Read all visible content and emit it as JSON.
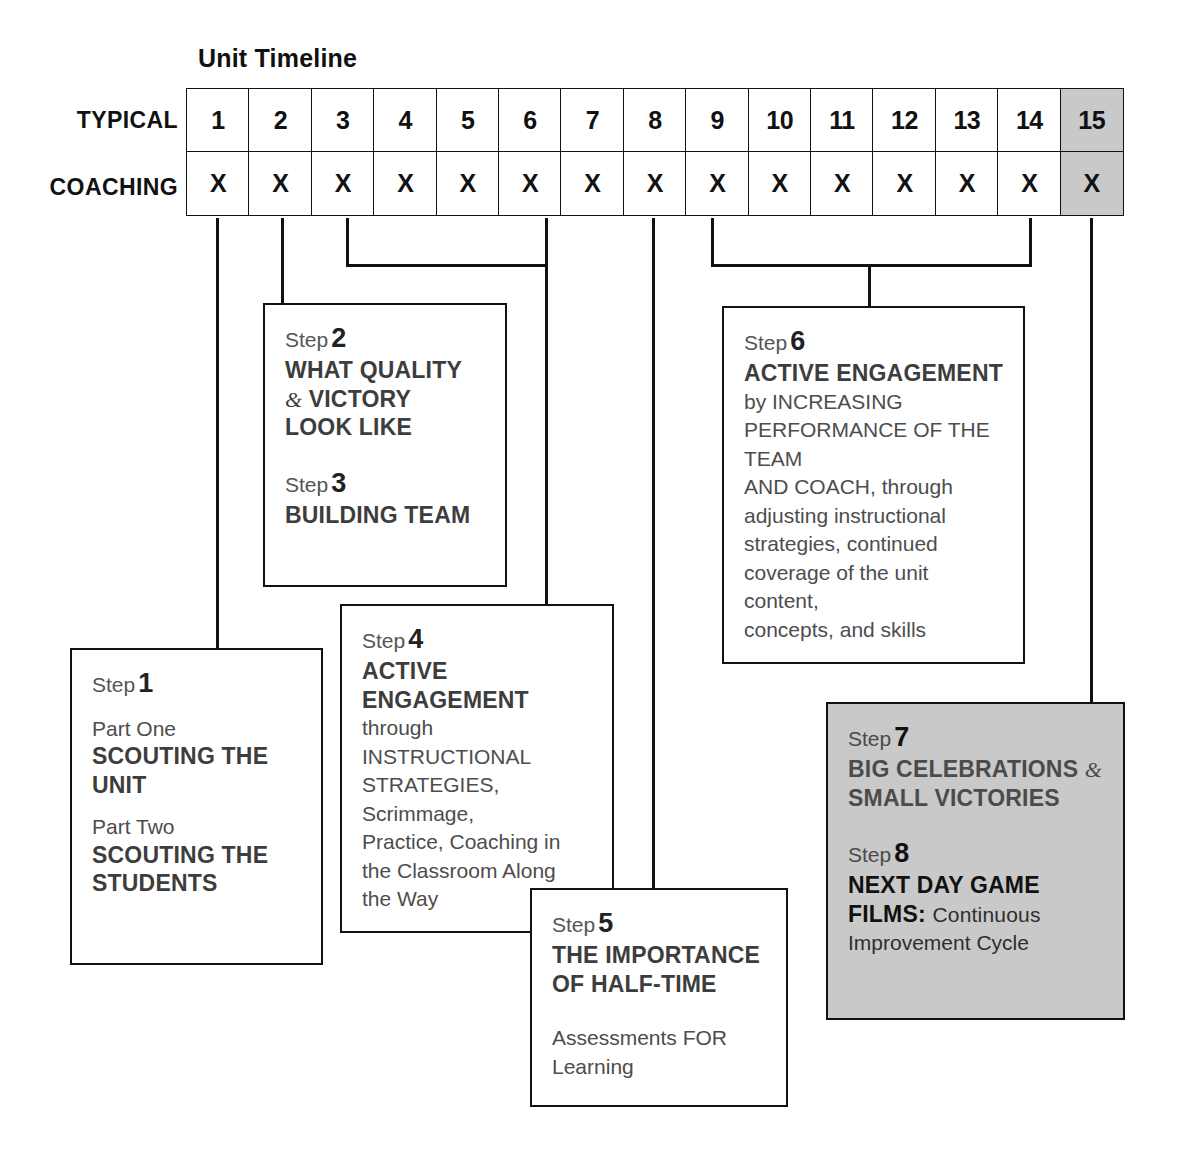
{
  "title": "Unit Timeline",
  "timeline": {
    "rows": [
      {
        "label": "TYPICAL",
        "name": "typical",
        "cells": [
          "1",
          "2",
          "3",
          "4",
          "5",
          "6",
          "7",
          "8",
          "9",
          "10",
          "11",
          "12",
          "13",
          "14",
          "15"
        ]
      },
      {
        "label": "COACHING",
        "name": "coaching",
        "cells": [
          "X",
          "X",
          "X",
          "X",
          "X",
          "X",
          "X",
          "X",
          "X",
          "X",
          "X",
          "X",
          "X",
          "X",
          "X"
        ]
      }
    ],
    "shaded_column_index": 14,
    "shaded_color": "#c9c9c9"
  },
  "steps": {
    "step1": {
      "step_label": "Step",
      "number": "1",
      "part_one_label": "Part One",
      "part_one_title_line1": "SCOUTING THE",
      "part_one_title_line2": "UNIT",
      "part_two_label": "Part Two",
      "part_two_title_line1": "SCOUTING THE",
      "part_two_title_line2": "STUDENTS"
    },
    "step2": {
      "step_label": "Step",
      "number": "2",
      "title_line1": "WHAT QUALITY",
      "amp": "&",
      "title_line2": "VICTORY",
      "title_line3": "LOOK LIKE"
    },
    "step3": {
      "step_label": "Step",
      "number": "3",
      "title": "BUILDING TEAM"
    },
    "step4": {
      "step_label": "Step",
      "number": "4",
      "title_line1": "ACTIVE",
      "title_line2": "ENGAGEMENT",
      "body_line1": "through INSTRUCTIONAL",
      "body_line2": "STRATEGIES, Scrimmage,",
      "body_line3": "Practice, Coaching in",
      "body_line4": "the Classroom Along",
      "body_line5": "the Way"
    },
    "step5": {
      "step_label": "Step",
      "number": "5",
      "title_line1": "THE IMPORTANCE",
      "title_line2": "OF HALF-TIME",
      "body_line1": "Assessments FOR",
      "body_line2": "Learning"
    },
    "step6": {
      "step_label": "Step",
      "number": "6",
      "title": "ACTIVE ENGAGEMENT",
      "body_line1": "by INCREASING",
      "body_line2": "PERFORMANCE OF THE TEAM",
      "body_line3": "AND COACH, through",
      "body_line4": "adjusting instructional",
      "body_line5": "strategies, continued",
      "body_line6": "coverage of the unit content,",
      "body_line7": "concepts, and skills"
    },
    "step7": {
      "step_label": "Step",
      "number": "7",
      "title_line1": "BIG CELEBRATIONS",
      "amp": "&",
      "title_line2": "SMALL VICTORIES"
    },
    "step8": {
      "step_label": "Step",
      "number": "8",
      "title_line1": "NEXT DAY GAME",
      "title_line2_bold": "FILMS:",
      "title_line2_rest": "Continuous",
      "body_line1": "Improvement Cycle"
    }
  },
  "colors": {
    "line": "#111111",
    "box_border": "#111111",
    "shaded_fill": "#c9c9c9",
    "heading_text": "#3d3d3d",
    "body_text": "#4d4d4d"
  }
}
